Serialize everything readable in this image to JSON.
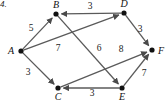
{
  "figure": {
    "index_label": "4.",
    "canvas": {
      "width": 166,
      "height": 100
    },
    "edge_color": "#5a5a5a",
    "node_color": "#111111",
    "text_color": "#111111"
  },
  "graph": {
    "type": "directed-weighted-graph",
    "nodes": [
      {
        "id": "A",
        "label": "A",
        "x": 21,
        "y": 51,
        "label_x": 11,
        "label_y": 51
      },
      {
        "id": "B",
        "label": "B",
        "x": 56,
        "y": 14,
        "label_x": 56,
        "label_y": 5
      },
      {
        "id": "C",
        "label": "C",
        "x": 58,
        "y": 88,
        "label_x": 58,
        "label_y": 97
      },
      {
        "id": "D",
        "label": "D",
        "x": 124,
        "y": 13,
        "label_x": 124,
        "label_y": 4
      },
      {
        "id": "E",
        "label": "E",
        "x": 122,
        "y": 88,
        "label_x": 122,
        "label_y": 97
      },
      {
        "id": "F",
        "label": "F",
        "x": 152,
        "y": 50,
        "label_x": 161,
        "label_y": 51
      }
    ],
    "edges": [
      {
        "id": "A-B",
        "from": "A",
        "to": "B",
        "weight": "5",
        "label_x": 31,
        "label_y": 28
      },
      {
        "id": "A-C",
        "from": "A",
        "to": "C",
        "weight": "3",
        "label_x": 28,
        "label_y": 72
      },
      {
        "id": "A-D",
        "from": "A",
        "to": "D",
        "weight": "7",
        "label_x": 58,
        "label_y": 48
      },
      {
        "id": "D-B",
        "from": "D",
        "to": "B",
        "weight": "3",
        "label_x": 90,
        "label_y": 6
      },
      {
        "id": "D-F",
        "from": "D",
        "to": "F",
        "weight": "3",
        "label_x": 140,
        "label_y": 29
      },
      {
        "id": "B-E",
        "from": "B",
        "to": "E",
        "weight": "6",
        "label_x": 99,
        "label_y": 48
      },
      {
        "id": "C-F",
        "from": "C",
        "to": "F",
        "weight": "8",
        "label_x": 121,
        "label_y": 49
      },
      {
        "id": "E-C",
        "from": "E",
        "to": "C",
        "weight": "3",
        "label_x": 92,
        "label_y": 93
      },
      {
        "id": "E-F",
        "from": "E",
        "to": "F",
        "weight": "7",
        "label_x": 144,
        "label_y": 73
      }
    ]
  }
}
